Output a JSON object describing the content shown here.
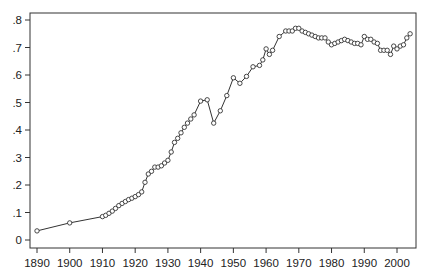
{
  "chart_data": {
    "type": "line",
    "title": "",
    "xlabel": "",
    "ylabel": "",
    "xlim": [
      1888,
      2006
    ],
    "ylim": [
      -0.01,
      0.83
    ],
    "grid": false,
    "legend": null,
    "marker": "open-circle",
    "line_color": "#333333",
    "x_ticks": [
      1890,
      1900,
      1910,
      1920,
      1930,
      1940,
      1950,
      1960,
      1970,
      1980,
      1990,
      2000
    ],
    "x_tick_labels": [
      "1890",
      "1900",
      "1910",
      "1920",
      "1930",
      "1940",
      "1950",
      "1960",
      "1970",
      "1980",
      "1990",
      "2000"
    ],
    "y_ticks": [
      0,
      0.1,
      0.2,
      0.3,
      0.4,
      0.5,
      0.6,
      0.7,
      0.8
    ],
    "y_tick_labels": [
      "0",
      ".1",
      ".2",
      ".3",
      ".4",
      ".5",
      ".6",
      ".7",
      ".8"
    ],
    "x": [
      1890,
      1900,
      1910,
      1911,
      1912,
      1913,
      1914,
      1915,
      1916,
      1917,
      1918,
      1919,
      1920,
      1921,
      1922,
      1923,
      1924,
      1925,
      1926,
      1927,
      1928,
      1929,
      1930,
      1931,
      1932,
      1933,
      1934,
      1935,
      1936,
      1937,
      1938,
      1940,
      1942,
      1944,
      1946,
      1948,
      1950,
      1952,
      1954,
      1956,
      1958,
      1959,
      1960,
      1961,
      1962,
      1964,
      1966,
      1967,
      1968,
      1969,
      1970,
      1971,
      1972,
      1973,
      1974,
      1975,
      1976,
      1977,
      1978,
      1979,
      1980,
      1981,
      1982,
      1983,
      1984,
      1985,
      1986,
      1987,
      1988,
      1989,
      1990,
      1991,
      1992,
      1993,
      1994,
      1995,
      1996,
      1997,
      1998,
      1999,
      2000,
      2001,
      2002,
      2003,
      2004
    ],
    "values": [
      0.033,
      0.062,
      0.085,
      0.09,
      0.097,
      0.105,
      0.115,
      0.125,
      0.133,
      0.14,
      0.147,
      0.152,
      0.158,
      0.165,
      0.175,
      0.21,
      0.24,
      0.25,
      0.265,
      0.265,
      0.27,
      0.28,
      0.29,
      0.32,
      0.355,
      0.37,
      0.39,
      0.41,
      0.425,
      0.44,
      0.455,
      0.505,
      0.51,
      0.425,
      0.47,
      0.525,
      0.59,
      0.57,
      0.595,
      0.63,
      0.635,
      0.655,
      0.695,
      0.675,
      0.69,
      0.74,
      0.76,
      0.76,
      0.76,
      0.77,
      0.77,
      0.76,
      0.755,
      0.75,
      0.745,
      0.74,
      0.735,
      0.735,
      0.735,
      0.72,
      0.71,
      0.715,
      0.72,
      0.725,
      0.73,
      0.725,
      0.72,
      0.715,
      0.715,
      0.71,
      0.74,
      0.73,
      0.73,
      0.72,
      0.715,
      0.69,
      0.69,
      0.69,
      0.675,
      0.705,
      0.695,
      0.705,
      0.71,
      0.735,
      0.75
    ]
  }
}
